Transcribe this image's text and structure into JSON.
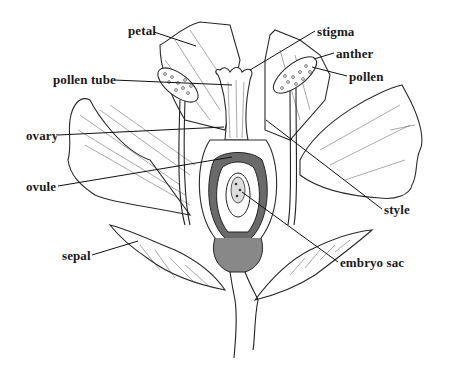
{
  "figure": {
    "colors": {
      "ink": "#1a1a1a",
      "background": "#ffffff",
      "shade": "#555555"
    }
  },
  "labels": [
    {
      "id": "petal",
      "text": "petal",
      "x": 128,
      "y": 24
    },
    {
      "id": "pollen-tube",
      "text": "pollen tube",
      "x": 53,
      "y": 73
    },
    {
      "id": "ovary",
      "text": "ovary",
      "x": 26,
      "y": 129
    },
    {
      "id": "ovule",
      "text": "ovule",
      "x": 26,
      "y": 180
    },
    {
      "id": "sepal",
      "text": "sepal",
      "x": 62,
      "y": 249
    },
    {
      "id": "stigma",
      "text": "stigma",
      "x": 317,
      "y": 25
    },
    {
      "id": "anther",
      "text": "anther",
      "x": 336,
      "y": 47
    },
    {
      "id": "pollen",
      "text": "pollen",
      "x": 349,
      "y": 70
    },
    {
      "id": "style",
      "text": "style",
      "x": 384,
      "y": 203
    },
    {
      "id": "embryo-sac",
      "text": "embryo sac",
      "x": 340,
      "y": 256
    }
  ]
}
